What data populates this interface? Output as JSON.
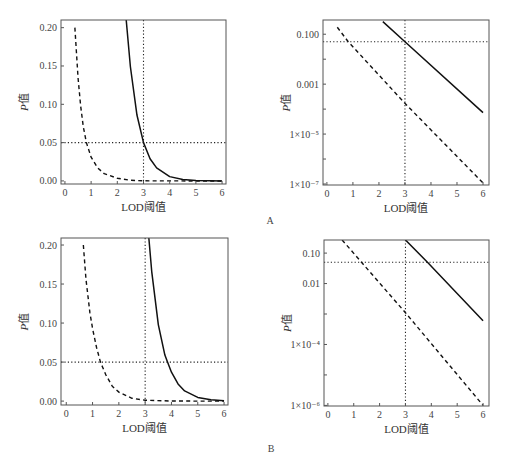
{
  "figure": {
    "panels": [
      "A",
      "B"
    ]
  },
  "chart_data": [
    {
      "id": "A-left",
      "panel": "A",
      "type": "line",
      "yscale": "linear",
      "xlabel": "LOD阈值",
      "ylabel_italic": "P",
      "ylabel_rest": "值",
      "xlim": [
        -0.15,
        6.15
      ],
      "ylim": [
        -0.004,
        0.21
      ],
      "xticks": [
        0,
        1,
        2,
        3,
        4,
        5,
        6
      ],
      "yticks": [
        0.0,
        0.05,
        0.1,
        0.15,
        0.2
      ],
      "ytick_labels": [
        "0.00",
        "0.05",
        "0.10",
        "0.15",
        "0.20"
      ],
      "reference_lines": {
        "vertical_x": 3,
        "horizontal_y": 0.05,
        "style": "dotted"
      },
      "series": [
        {
          "name": "solid",
          "style": "solid",
          "x": [
            2.34,
            2.5,
            2.75,
            3.0,
            3.25,
            3.5,
            4.0,
            4.5,
            5.0,
            5.5,
            6.0
          ],
          "y": [
            0.21,
            0.149,
            0.086,
            0.05,
            0.029,
            0.017,
            0.0056,
            0.0019,
            0.00064,
            0.00021,
            7e-05
          ]
        },
        {
          "name": "dashed",
          "style": "dashed",
          "x": [
            0.38,
            0.5,
            0.6,
            0.7,
            0.82,
            1.0,
            1.25,
            1.5,
            2.0,
            2.5,
            3.0,
            4.0,
            5.0,
            6.0
          ],
          "y": [
            0.2,
            0.135,
            0.098,
            0.071,
            0.05,
            0.031,
            0.017,
            0.0095,
            0.0035,
            0.0009,
            0.00017,
            1.4e-05,
            1.2e-06,
            1.1e-07
          ]
        }
      ]
    },
    {
      "id": "A-right",
      "panel": "A",
      "type": "line",
      "yscale": "log",
      "xlabel": "LOD阈值",
      "ylabel_italic": "P",
      "ylabel_rest": "值",
      "xlim": [
        -0.15,
        6.23
      ],
      "ylim_log10": [
        -7.04,
        -0.43
      ],
      "xticks": [
        0,
        1,
        2,
        3,
        4,
        5,
        6
      ],
      "yticks_log10": [
        -1,
        -3,
        -5,
        -7
      ],
      "ytick_labels": [
        "0.100",
        "0.001",
        "1×10⁻⁵",
        "1×10⁻⁷"
      ],
      "minor_yticks_log10": [
        -2,
        -4,
        -6
      ],
      "reference_lines": {
        "vertical_x": 3,
        "horizontal_y": 0.05,
        "style": "dotted"
      },
      "series": [
        {
          "name": "solid",
          "style": "solid",
          "x": [
            2.15,
            3.0,
            6.0
          ],
          "y": [
            0.32,
            0.05,
            7.2e-05
          ]
        },
        {
          "name": "dashed",
          "style": "dashed",
          "x": [
            0.4,
            0.82,
            3.0,
            6.0
          ],
          "y": [
            0.19,
            0.05,
            0.00017,
            1.1e-07
          ]
        }
      ]
    },
    {
      "id": "B-left",
      "panel": "B",
      "type": "line",
      "yscale": "linear",
      "xlabel": "LOD阈值",
      "ylabel_italic": "P",
      "ylabel_rest": "值",
      "xlim": [
        -0.2,
        6.15
      ],
      "ylim": [
        -0.005,
        0.209
      ],
      "xticks": [
        0,
        1,
        2,
        3,
        4,
        5,
        6
      ],
      "yticks": [
        0.0,
        0.05,
        0.1,
        0.15,
        0.2
      ],
      "ytick_labels": [
        "0.00",
        "0.05",
        "0.10",
        "0.15",
        "0.20"
      ],
      "reference_lines": {
        "vertical_x": 3,
        "horizontal_y": 0.05,
        "style": "dotted"
      },
      "series": [
        {
          "name": "solid",
          "style": "solid",
          "x": [
            3.14,
            3.25,
            3.5,
            3.75,
            3.85,
            4.0,
            4.25,
            4.5,
            5.0,
            5.5,
            6.0
          ],
          "y": [
            0.209,
            0.166,
            0.098,
            0.059,
            0.05,
            0.037,
            0.022,
            0.013,
            0.0047,
            0.0017,
            0.0006
          ]
        },
        {
          "name": "dashed",
          "style": "dashed",
          "x": [
            0.65,
            0.75,
            0.9,
            1.0,
            1.15,
            1.3,
            1.5,
            1.75,
            2.0,
            2.5,
            3.0,
            4.0,
            5.0,
            6.0
          ],
          "y": [
            0.2,
            0.156,
            0.113,
            0.093,
            0.069,
            0.05,
            0.034,
            0.019,
            0.0115,
            0.0036,
            0.0011,
            0.0001,
            1e-05,
            1e-06
          ]
        }
      ]
    },
    {
      "id": "B-right",
      "panel": "B",
      "type": "line",
      "yscale": "log",
      "xlabel": "LOD阈值",
      "ylabel_italic": "P",
      "ylabel_rest": "值",
      "xlim": [
        -0.15,
        6.23
      ],
      "ylim_log10": [
        -6.02,
        -0.57
      ],
      "xticks": [
        0,
        1,
        2,
        3,
        4,
        5,
        6
      ],
      "yticks_log10": [
        -1,
        -2,
        -4,
        -6
      ],
      "ytick_labels": [
        "0.10",
        "0.01",
        "1×10⁻⁴",
        "1×10⁻⁶"
      ],
      "minor_yticks_log10": [
        -3,
        -5
      ],
      "reference_lines": {
        "vertical_x": 3,
        "horizontal_y": 0.05,
        "style": "dotted"
      },
      "series": [
        {
          "name": "solid",
          "style": "solid",
          "x": [
            3.0,
            3.85,
            6.0
          ],
          "y": [
            0.27,
            0.05,
            0.0006
          ]
        },
        {
          "name": "dashed",
          "style": "dashed",
          "x": [
            0.55,
            1.3,
            3.0,
            6.0
          ],
          "y": [
            0.27,
            0.05,
            0.0011,
            1e-06
          ]
        }
      ]
    }
  ],
  "layout": {
    "plots": {
      "A-left": {
        "left": 61,
        "top": 20,
        "right": 226,
        "bottom": 184
      },
      "A-right": {
        "left": 323,
        "top": 20,
        "right": 489,
        "bottom": 185
      },
      "B-left": {
        "left": 61,
        "top": 238,
        "right": 228,
        "bottom": 405
      },
      "B-right": {
        "left": 324,
        "top": 240,
        "right": 489,
        "bottom": 406
      }
    },
    "panel_labels": {
      "A": {
        "x": 270,
        "y": 224
      },
      "B": {
        "x": 271,
        "y": 452
      }
    }
  }
}
